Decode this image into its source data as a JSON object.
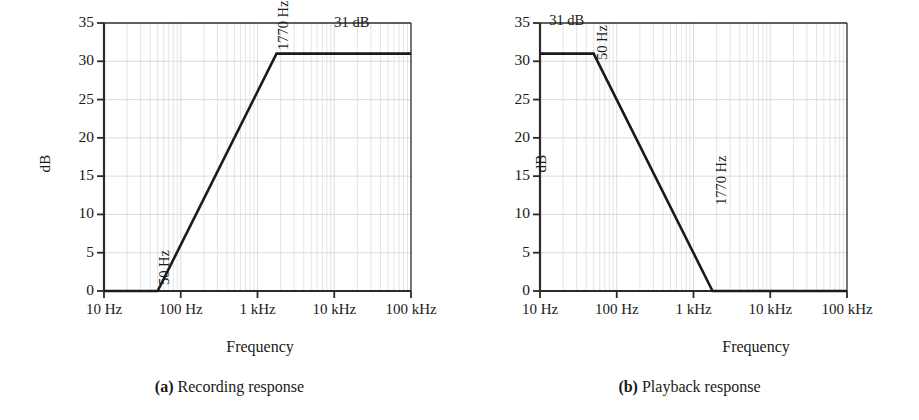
{
  "figure": {
    "panels": [
      {
        "id": "a",
        "caption_tag": "(a)",
        "caption_text": "Recording response",
        "chart_data": {
          "type": "line",
          "title": "",
          "xlabel": "Frequency",
          "ylabel": "dB",
          "xscale": "log",
          "xlim": [
            10,
            100000
          ],
          "ylim": [
            0,
            35
          ],
          "yticks": [
            0,
            5,
            10,
            15,
            20,
            25,
            30,
            35
          ],
          "xticks": [
            10,
            100,
            1000,
            10000,
            100000
          ],
          "xticklabels": [
            "10 Hz",
            "100 Hz",
            "1 kHz",
            "10 kHz",
            "100 kHz"
          ],
          "grid": true,
          "series": [
            {
              "name": "Recording response",
              "x": [
                10,
                50,
                1770,
                100000
              ],
              "y": [
                0,
                0,
                31,
                31
              ]
            }
          ],
          "annotations": [
            {
              "text": "50 Hz",
              "x": 50,
              "y": 0,
              "rotation": 90
            },
            {
              "text": "1770 Hz",
              "x": 1770,
              "y": 31,
              "rotation": 90
            },
            {
              "text": "31 dB",
              "x": 12000,
              "y": 33,
              "rotation": 0
            }
          ]
        }
      },
      {
        "id": "b",
        "caption_tag": "(b)",
        "caption_text": "Playback response",
        "chart_data": {
          "type": "line",
          "title": "",
          "xlabel": "Frequency",
          "ylabel": "dB",
          "xscale": "log",
          "xlim": [
            10,
            100000
          ],
          "ylim": [
            0,
            35
          ],
          "yticks": [
            0,
            5,
            10,
            15,
            20,
            25,
            30,
            35
          ],
          "xticks": [
            10,
            100,
            1000,
            10000,
            100000
          ],
          "xticklabels": [
            "10 Hz",
            "100 Hz",
            "1 kHz",
            "10 kHz",
            "100 kHz"
          ],
          "grid": true,
          "series": [
            {
              "name": "Playback response",
              "x": [
                10,
                50,
                1770,
                100000
              ],
              "y": [
                31,
                31,
                0,
                0
              ]
            }
          ],
          "annotations": [
            {
              "text": "31 dB",
              "x": 14,
              "y": 33,
              "rotation": 0
            },
            {
              "text": "50 Hz",
              "x": 50,
              "y": 31,
              "rotation": 90
            },
            {
              "text": "1770 Hz",
              "x": 1770,
              "y": 0,
              "rotation": 90
            }
          ]
        }
      }
    ]
  },
  "colors": {
    "curve": "#1a1a1a",
    "axis": "#2b2b2b",
    "grid": "#d8d8d8",
    "text": "#1a1a1a",
    "background": "#ffffff"
  }
}
